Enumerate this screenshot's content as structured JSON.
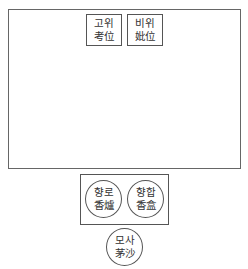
{
  "diagram": {
    "shrine_hall": {
      "tablets": [
        {
          "hangul": "고위",
          "hanja": "考位"
        },
        {
          "hangul": "비위",
          "hanja": "妣位"
        }
      ]
    },
    "incense_table": {
      "items": [
        {
          "hangul": "향로",
          "hanja": "香爐"
        },
        {
          "hangul": "향합",
          "hanja": "香盒"
        }
      ]
    },
    "moss_sand": {
      "hangul": "모사",
      "hanja": "茅沙"
    }
  }
}
